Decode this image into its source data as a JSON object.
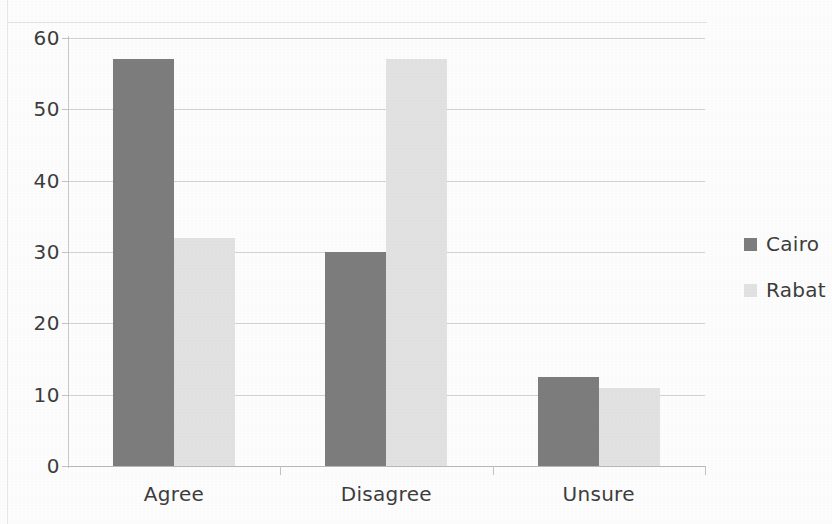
{
  "chart_data": {
    "type": "bar",
    "title": "",
    "subtitle": "",
    "xlabel": "",
    "ylabel": "",
    "categories": [
      "Agree",
      "Disagree",
      "Unsure"
    ],
    "series": [
      {
        "name": "Cairo",
        "color": "#7d7d7d",
        "values": [
          57,
          30,
          12.5
        ]
      },
      {
        "name": "Rabat",
        "color": "#e2e2e2",
        "values": [
          32,
          57,
          11
        ]
      }
    ],
    "ylim": [
      0,
      60
    ],
    "yticks": [
      0,
      10,
      20,
      30,
      40,
      50,
      60
    ],
    "ytick_labels": [
      "0",
      "10",
      "20",
      "30",
      "40",
      "50",
      "60"
    ],
    "grid": true,
    "grid_axis": "y",
    "legend_position": "right",
    "legend": [
      {
        "label": "Cairo",
        "swatch": "legend-swatch-cairo"
      },
      {
        "label": "Rabat",
        "swatch": "legend-swatch-rabat"
      }
    ]
  }
}
